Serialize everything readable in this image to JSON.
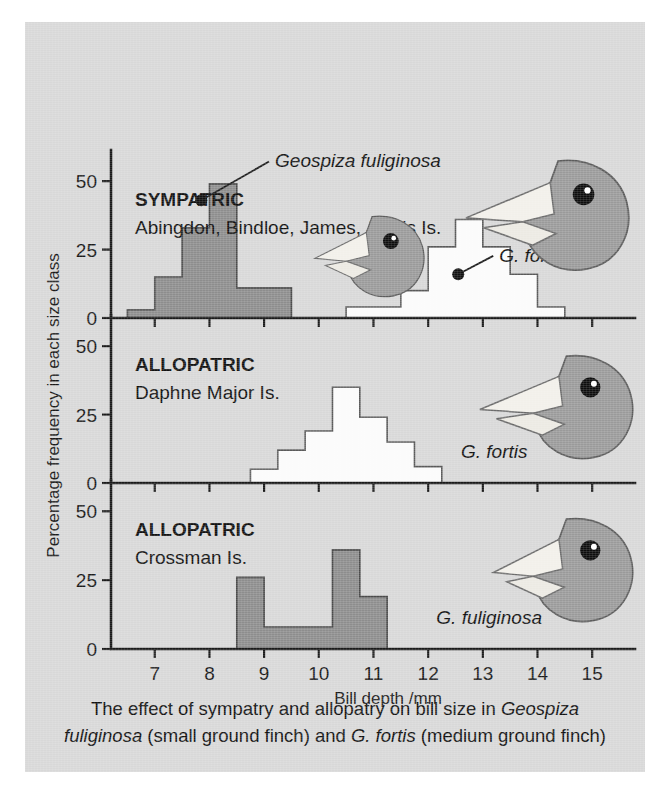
{
  "figure": {
    "background_color": "#d8d8d8",
    "gray_fill": "#8d8d8d",
    "white_fill": "#fbfbfb",
    "caption_line1_a": "The effect of sympatry and allopatry on bill size in ",
    "caption_line1_b": "Geospiza",
    "caption_line2_a": "fuliginosa",
    "caption_line2_b": " (small ground finch) and ",
    "caption_line2_c": "G. fortis",
    "caption_line2_d": " (medium ground finch)"
  },
  "axes": {
    "xlabel": "Bill depth /mm",
    "ylabel": "Percentage frequency in each size class",
    "xticks": [
      "7",
      "8",
      "9",
      "10",
      "11",
      "12",
      "13",
      "14",
      "15"
    ],
    "xtick_values": [
      7,
      8,
      9,
      10,
      11,
      12,
      13,
      14,
      15
    ],
    "yticks": [
      "0",
      "25",
      "50"
    ],
    "ytick_values": [
      0,
      25,
      50
    ],
    "xlim": [
      6.2,
      15.6
    ],
    "ylim": [
      0,
      57
    ]
  },
  "panels": [
    {
      "id": "sympatric",
      "title": "SYMPATRIC",
      "subtitle": "Abingdon, Bindloe, James, Jervis Is.",
      "annotations": [
        {
          "text": "Geospiza fuliginosa",
          "dot_x": 7.85,
          "dot_y": 43,
          "label_x": 9.2,
          "label_y": 55,
          "anchor": "start"
        },
        {
          "text": "G. fortis",
          "dot_x": 12.55,
          "dot_y": 16,
          "label_x": 13.3,
          "label_y": 20.5,
          "anchor": "start"
        }
      ],
      "birds": [
        {
          "species": "G. fuliginosa",
          "cx": 350,
          "cy": 232,
          "scale": 0.72,
          "flip": false
        },
        {
          "species": "G. fortis",
          "cx": 537,
          "cy": 190,
          "scale": 0.98,
          "flip": false
        }
      ]
    },
    {
      "id": "allopatric-daphne",
      "title": "ALLOPATRIC",
      "subtitle": "Daphne Major Is.",
      "annotations": [
        {
          "text": "G. fortis",
          "dot_x": null,
          "dot_y": null,
          "label_x": 12.6,
          "label_y": 9,
          "anchor": "start"
        }
      ],
      "birds": [
        {
          "species": "G. fortis",
          "cx": 545,
          "cy": 382,
          "scale": 0.92,
          "flip": false
        }
      ]
    },
    {
      "id": "allopatric-crossman",
      "title": "ALLOPATRIC",
      "subtitle": "Crossman Is.",
      "annotations": [
        {
          "text": "G. fuliginosa",
          "dot_x": null,
          "dot_y": null,
          "label_x": 12.15,
          "label_y": 9,
          "anchor": "start"
        }
      ],
      "birds": [
        {
          "species": "G. fuliginosa",
          "cx": 545,
          "cy": 545,
          "scale": 0.92,
          "flip": false
        }
      ]
    }
  ],
  "chart_data": {
    "type": "histogram",
    "xlabel": "Bill depth /mm",
    "ylabel": "Percentage frequency in each size class",
    "xlim": [
      6.2,
      15.6
    ],
    "ylim": [
      0,
      57
    ],
    "grid": false,
    "legend": "none",
    "bin_width": 0.5,
    "panels": [
      {
        "name": "SYMPATRIC - Abingdon, Bindloe, James, Jervis Is.",
        "series": [
          {
            "name": "Geospiza fuliginosa",
            "color": "#8d8d8d",
            "bin_starts": [
              6.5,
              7.0,
              7.5,
              8.0,
              8.5,
              9.0
            ],
            "values": [
              3,
              15,
              33,
              49,
              11,
              11
            ]
          },
          {
            "name": "G. fortis",
            "color": "#fbfbfb",
            "bin_starts": [
              10.5,
              11.0,
              11.5,
              12.0,
              12.5,
              13.0,
              13.5
            ],
            "values": [
              4,
              4,
              10,
              26,
              36,
              26,
              16,
              4
            ]
          }
        ]
      },
      {
        "name": "ALLOPATRIC - Daphne Major Is.",
        "series": [
          {
            "name": "G. fortis",
            "color": "#fbfbfb",
            "bin_starts": [
              8.75,
              9.25,
              9.75,
              10.25,
              10.75,
              11.25,
              11.75
            ],
            "values": [
              5,
              12,
              19,
              35,
              24,
              15,
              6
            ]
          }
        ]
      },
      {
        "name": "ALLOPATRIC - Crossman Is.",
        "series": [
          {
            "name": "G. fuliginosa",
            "color": "#8d8d8d",
            "bin_starts": [
              8.5,
              9.0,
              10.25,
              10.75
            ],
            "values": [
              26,
              8,
              36,
              19
            ]
          }
        ]
      }
    ]
  }
}
